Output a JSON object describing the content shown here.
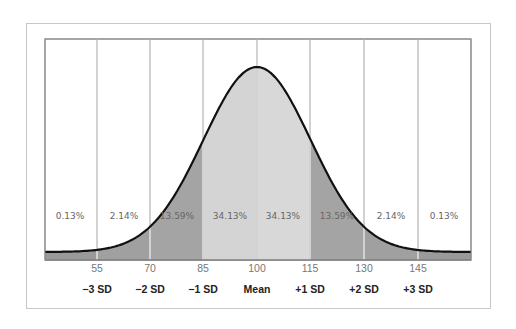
{
  "chart_data": {
    "type": "area",
    "title": "",
    "subtitle": "",
    "xlabel": "",
    "ylabel": "",
    "mean": 100,
    "sd": 15,
    "x_ticks": [
      55,
      70,
      85,
      100,
      115,
      130,
      145
    ],
    "sd_labels": [
      "−3 SD",
      "−2 SD",
      "−1 SD",
      "Mean",
      "+1 SD",
      "+2 SD",
      "+3 SD"
    ],
    "bands": [
      {
        "range": "< 55",
        "percent": "0.13%",
        "value": 0.13
      },
      {
        "range": "55–70",
        "percent": "2.14%",
        "value": 2.14
      },
      {
        "range": "70–85",
        "percent": "13.59%",
        "value": 13.59
      },
      {
        "range": "85–100",
        "percent": "34.13%",
        "value": 34.13
      },
      {
        "range": "100–115",
        "percent": "34.13%",
        "value": 34.13
      },
      {
        "range": "115–130",
        "percent": "13.59%",
        "value": 13.59
      },
      {
        "range": "130–145",
        "percent": "2.14%",
        "value": 2.14
      },
      {
        "range": "> 145",
        "percent": "0.13%",
        "value": 0.13
      }
    ],
    "xlim": [
      45,
      155
    ],
    "grid": {
      "vertical": true,
      "horizontal": false
    },
    "legend": "none",
    "colors": {
      "outer_band": "#9a9a9a",
      "middle_band": "#a8a8a8",
      "center_band": "#d6d6d6",
      "curve": "#111111",
      "grid": "#d4d4d4"
    }
  },
  "labels": {
    "ticks": [
      "55",
      "70",
      "85",
      "100",
      "115",
      "130",
      "145"
    ],
    "sd": [
      "−3 SD",
      "−2 SD",
      "−1 SD",
      "Mean",
      "+1 SD",
      "+2 SD",
      "+3 SD"
    ],
    "pct": [
      "0.13%",
      "2.14%",
      "13.59%",
      "34.13%",
      "34.13%",
      "13.59%",
      "2.14%",
      "0.13%"
    ]
  }
}
